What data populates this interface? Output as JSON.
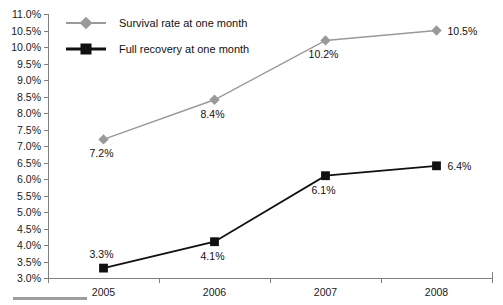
{
  "chart_data": {
    "type": "line",
    "title": "",
    "xlabel": "",
    "ylabel": "",
    "categories": [
      "2005",
      "2006",
      "2007",
      "2008"
    ],
    "ylim": [
      3.0,
      11.0
    ],
    "ytick_step": 0.5,
    "ytick_labels": [
      "11.0%",
      "10.5%",
      "10.0%",
      "9.5%",
      "9.0%",
      "8.5%",
      "8.0%",
      "7.5%",
      "7.0%",
      "6.5%",
      "6.0%",
      "5.5%",
      "5.0%",
      "4.5%",
      "4.0%",
      "3.5%",
      "3.0%"
    ],
    "ytick_values": [
      11.0,
      10.5,
      10.0,
      9.5,
      9.0,
      8.5,
      8.0,
      7.5,
      7.0,
      6.5,
      6.0,
      5.5,
      5.0,
      4.5,
      4.0,
      3.5,
      3.0
    ],
    "grid": false,
    "legend_position": "top-left-inside",
    "series": [
      {
        "name": "Survival rate at one month",
        "color": "#9a9a9a",
        "marker": "diamond",
        "values": [
          7.2,
          8.4,
          10.2,
          10.5
        ],
        "data_labels": [
          "7.2%",
          "8.4%",
          "10.2%",
          "10.5%"
        ],
        "label_positions": [
          "below",
          "below",
          "below",
          "right"
        ]
      },
      {
        "name": "Full recovery at one month",
        "color": "#111111",
        "marker": "square",
        "values": [
          3.3,
          4.1,
          6.1,
          6.4
        ],
        "data_labels": [
          "3.3%",
          "4.1%",
          "6.1%",
          "6.4%"
        ],
        "label_positions": [
          "above",
          "below",
          "below",
          "right"
        ]
      }
    ]
  },
  "legend": {
    "items": [
      {
        "label": "Survival rate at one month",
        "marker": "diamond",
        "color": "#9a9a9a"
      },
      {
        "label": "Full recovery at one month",
        "marker": "square",
        "color": "#111111"
      }
    ]
  }
}
